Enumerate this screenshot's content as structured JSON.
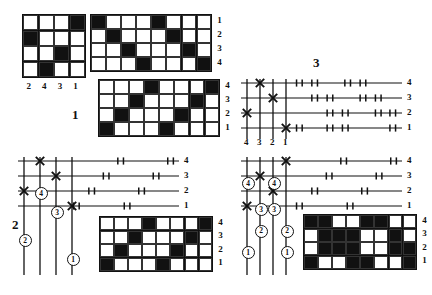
{
  "document": {
    "title": "Weaving drafts: threading diagrams and drawdowns",
    "type": "technical-diagram-plate"
  },
  "figures": [
    {
      "id": "fig-1",
      "label": "1"
    },
    {
      "id": "fig-2",
      "label": "2"
    },
    {
      "id": "fig-3",
      "label": "3"
    }
  ],
  "grids": {
    "tieup_small": {
      "name": "tie-up-4x4",
      "cols": 4,
      "rows": 4,
      "filled": [
        [
          1,
          4
        ],
        [
          2,
          1
        ],
        [
          3,
          3
        ],
        [
          4,
          2
        ]
      ],
      "column_labels": [
        "2",
        "4",
        "3",
        "1"
      ],
      "row_labels": []
    },
    "threading_top": {
      "name": "threading-drawdown-8x4-top",
      "cols": 8,
      "rows": 4,
      "filled": [
        [
          1,
          1
        ],
        [
          1,
          5
        ],
        [
          2,
          2
        ],
        [
          2,
          6
        ],
        [
          3,
          3
        ],
        [
          3,
          7
        ],
        [
          4,
          4
        ],
        [
          4,
          8
        ]
      ],
      "row_labels": [
        "1",
        "2",
        "3",
        "4"
      ],
      "row_label_side": "right"
    },
    "drawdown_fig1": {
      "name": "drawdown-8x4-fig1",
      "cols": 8,
      "rows": 4,
      "filled": [
        [
          1,
          4
        ],
        [
          1,
          8
        ],
        [
          2,
          3
        ],
        [
          2,
          7
        ],
        [
          3,
          2
        ],
        [
          3,
          6
        ],
        [
          4,
          1
        ],
        [
          4,
          5
        ]
      ],
      "row_labels": [
        "4",
        "3",
        "2",
        "1"
      ],
      "row_label_side": "right"
    },
    "drawdown_fig2": {
      "name": "drawdown-8x4-fig2",
      "cols": 8,
      "rows": 4,
      "filled": [
        [
          1,
          4
        ],
        [
          1,
          8
        ],
        [
          2,
          3
        ],
        [
          2,
          7
        ],
        [
          3,
          2
        ],
        [
          3,
          6
        ],
        [
          4,
          1
        ],
        [
          4,
          5
        ]
      ],
      "row_labels": [
        "4",
        "3",
        "2",
        "1"
      ],
      "row_label_side": "right"
    },
    "drawdown_fig3": {
      "name": "drawdown-8x4-fig3-inverse",
      "cols": 8,
      "rows": 4,
      "filled": [
        [
          1,
          1
        ],
        [
          1,
          2
        ],
        [
          1,
          5
        ],
        [
          1,
          6
        ],
        [
          2,
          2
        ],
        [
          2,
          3
        ],
        [
          2,
          4
        ],
        [
          2,
          7
        ],
        [
          3,
          2
        ],
        [
          3,
          3
        ],
        [
          3,
          4
        ],
        [
          3,
          7
        ],
        [
          3,
          8
        ],
        [
          4,
          1
        ],
        [
          4,
          4
        ],
        [
          4,
          5
        ],
        [
          4,
          8
        ]
      ],
      "row_labels": [
        "4",
        "3",
        "2",
        "1"
      ],
      "row_label_side": "right"
    }
  },
  "threadings": {
    "fig2": {
      "name": "threading-diagram-fig2",
      "shaft_labels": [
        "4",
        "3",
        "2",
        "1"
      ],
      "shaft_label_side": "right",
      "warp_count": 4,
      "warp_labels_bottom": [],
      "crosses": [
        {
          "shaft": 4,
          "warp": 2
        },
        {
          "shaft": 3,
          "warp": 3
        },
        {
          "shaft": 2,
          "warp": 1
        },
        {
          "shaft": 1,
          "warp": 4
        }
      ],
      "tick_pairs": {
        "4": [
          [
            0.62,
            0.655
          ],
          [
            0.93,
            0.965
          ]
        ],
        "3": [
          [
            0.53,
            0.565
          ],
          [
            0.84,
            0.875
          ]
        ],
        "2": [
          [
            0.44,
            0.475
          ],
          [
            0.75,
            0.785
          ]
        ],
        "1": [
          [
            0.345,
            0.38
          ],
          [
            0.66,
            0.695
          ]
        ]
      },
      "circled_numbers": [
        {
          "warp": 1,
          "value": "2",
          "depth": 0.7
        },
        {
          "warp": 2,
          "value": "4",
          "depth": 0.3
        },
        {
          "warp": 3,
          "value": "3",
          "depth": 0.46
        },
        {
          "warp": 4,
          "value": "1",
          "depth": 0.86
        }
      ]
    },
    "fig3_top": {
      "name": "threading-diagram-fig3-top",
      "shaft_labels": [
        "4",
        "3",
        "2",
        "1"
      ],
      "shaft_label_side": "right",
      "warp_count": 4,
      "warp_labels_bottom": [
        "4",
        "3",
        "2",
        "1"
      ],
      "crosses": [
        {
          "shaft": 4,
          "warp": 2
        },
        {
          "shaft": 3,
          "warp": 3
        },
        {
          "shaft": 2,
          "warp": 1
        },
        {
          "shaft": 1,
          "warp": 4
        }
      ],
      "tick_pairs": {
        "4": [
          [
            0.345,
            0.38
          ],
          [
            0.44,
            0.475
          ],
          [
            0.645,
            0.68
          ],
          [
            0.74,
            0.775
          ]
        ],
        "3": [
          [
            0.44,
            0.475
          ],
          [
            0.535,
            0.57
          ],
          [
            0.74,
            0.775
          ],
          [
            0.835,
            0.87
          ]
        ],
        "2": [
          [
            0.535,
            0.57
          ],
          [
            0.63,
            0.665
          ],
          [
            0.835,
            0.87
          ],
          [
            0.925,
            0.96
          ]
        ],
        "1": [
          [
            0.345,
            0.38
          ],
          [
            0.535,
            0.57
          ],
          [
            0.63,
            0.665
          ],
          [
            0.925,
            0.96
          ]
        ]
      },
      "circled_numbers": []
    },
    "fig3_bottom": {
      "name": "threading-diagram-fig3-bottom",
      "shaft_labels": [
        "4",
        "3",
        "2",
        "1"
      ],
      "shaft_label_side": "right",
      "warp_count": 4,
      "warp_labels_bottom": [],
      "crosses": [
        {
          "shaft": 4,
          "warp": 4
        },
        {
          "shaft": 3,
          "warp": 2
        },
        {
          "shaft": 2,
          "warp": 3
        },
        {
          "shaft": 1,
          "warp": 1
        }
      ],
      "tick_pairs": {
        "4": [
          [
            0.62,
            0.655
          ],
          [
            0.93,
            0.965
          ]
        ],
        "3": [
          [
            0.53,
            0.565
          ],
          [
            0.84,
            0.875
          ]
        ],
        "2": [
          [
            0.44,
            0.475
          ],
          [
            0.75,
            0.785
          ]
        ],
        "1": [
          [
            0.345,
            0.38
          ],
          [
            0.66,
            0.695
          ]
        ]
      },
      "circled_numbers": [
        {
          "warp": 1,
          "value": "4",
          "depth": 0.22
        },
        {
          "warp": 1,
          "value": "1",
          "depth": 0.8
        },
        {
          "warp": 2,
          "value": "3",
          "depth": 0.44
        },
        {
          "warp": 2,
          "value": "2",
          "depth": 0.62
        },
        {
          "warp": 3,
          "value": "4",
          "depth": 0.22
        },
        {
          "warp": 3,
          "value": "3",
          "depth": 0.44
        },
        {
          "warp": 4,
          "value": "2",
          "depth": 0.62
        },
        {
          "warp": 4,
          "value": "1",
          "depth": 0.8
        }
      ]
    }
  },
  "colors": {
    "ink": "#111111",
    "paper": "#ffffff",
    "rule": "#333333"
  }
}
